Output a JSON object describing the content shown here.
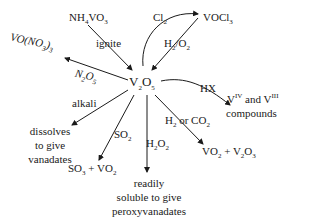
{
  "center": {
    "base": "V",
    "sub1": "2",
    "mid": "O",
    "sub2": "5"
  },
  "nodes": {
    "nh4vo3": {
      "a": "NH",
      "b": "4",
      "c": "VO",
      "d": "3"
    },
    "vocl3": {
      "a": "VOCl",
      "b": "3"
    },
    "vono33": {
      "a": "VO(NO",
      "b": "3",
      "c": ")",
      "d": "3"
    },
    "viv_viii": {
      "a": "V",
      "b": "IV",
      "c": " and V",
      "d": "III",
      "e": "compounds"
    },
    "dissolves": {
      "l1": "dissolves",
      "l2": "to give",
      "l3": "vanadates"
    },
    "so3vo2": {
      "a": "SO",
      "b": "3",
      "c": " + VO",
      "d": "2"
    },
    "readily": {
      "l1": "readily",
      "l2": "soluble to give",
      "l3": "peroxyvanadates"
    },
    "vo2v2o3": {
      "a": "VO",
      "b": "2",
      "c": " + V",
      "d": "2",
      "e": "O",
      "f": "3"
    }
  },
  "reagents": {
    "ignite": "ignite",
    "cl2": {
      "a": "Cl",
      "b": "2"
    },
    "h2o2_top": {
      "a": "H",
      "b": "2",
      "c": "/O",
      "d": "2"
    },
    "n2o5": {
      "a": "N",
      "b": "2",
      "c": "O",
      "d": "5"
    },
    "hx": "HX",
    "alkali": "alkali",
    "so2": {
      "a": "SO",
      "b": "2"
    },
    "h2o2": {
      "a": "H",
      "b": "2",
      "c": "O",
      "d": "2"
    },
    "h2co2": {
      "a": "H",
      "b": "2",
      "c": " or CO",
      "d": "2"
    }
  }
}
